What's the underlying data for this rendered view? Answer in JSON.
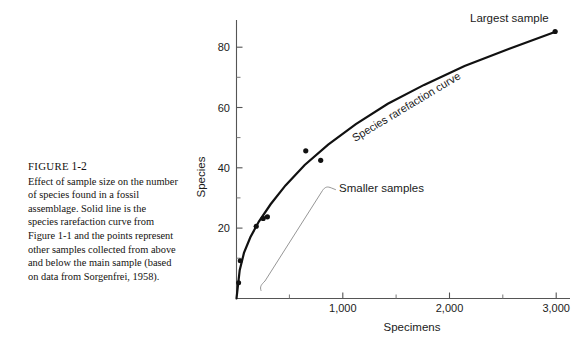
{
  "caption": {
    "figure_word": "FIGURE",
    "figure_number": "1-2",
    "text": "Effect of sample size on the number of species found in a fossil assemblage. Solid line is the species rarefaction curve from Figure 1-1 and the points represent other samples collected from above and below the main sample (based on data from Sorgenfrei, 1958)."
  },
  "chart_data": {
    "type": "line",
    "title": "",
    "xlabel": "Specimens",
    "ylabel": "Species",
    "xlim": [
      0,
      3150
    ],
    "ylim": [
      0,
      90
    ],
    "xticks": [
      1000,
      2000,
      3000
    ],
    "xtick_labels": [
      "1,000",
      "2,000",
      "3,000"
    ],
    "xminor_ticks": [
      500,
      1500,
      2500
    ],
    "yticks": [
      20,
      40,
      60,
      80
    ],
    "ytick_labels": [
      "20",
      "40",
      "60",
      "80"
    ],
    "yminor_ticks": [
      10,
      30,
      50,
      70
    ],
    "grid": false,
    "legend": "none",
    "series": [
      {
        "name": "Species rarefaction curve",
        "type": "line",
        "x": [
          0,
          30,
          70,
          130,
          210,
          320,
          460,
          640,
          860,
          1120,
          1420,
          1760,
          2140,
          2560,
          3000
        ],
        "y": [
          0,
          9,
          14.5,
          19.5,
          24.5,
          30,
          36,
          42.5,
          49,
          55.5,
          62,
          68,
          74,
          79.5,
          85
        ]
      },
      {
        "name": "Sample points",
        "type": "scatter",
        "points": [
          {
            "x": 20,
            "y": 5
          },
          {
            "x": 35,
            "y": 12
          },
          {
            "x": 185,
            "y": 23
          },
          {
            "x": 250,
            "y": 25.5
          },
          {
            "x": 290,
            "y": 26
          },
          {
            "x": 650,
            "y": 47
          },
          {
            "x": 790,
            "y": 44
          },
          {
            "x": 2990,
            "y": 85
          }
        ]
      }
    ],
    "annotations": [
      {
        "name": "largest-sample",
        "text": "Largest sample"
      },
      {
        "name": "smaller-samples",
        "text": "Smaller samples"
      },
      {
        "name": "curve-label",
        "text": "Species rarefaction curve"
      }
    ]
  },
  "colors": {
    "ink": "#1b1b1b",
    "curve": "#111111",
    "axis": "#555555",
    "leader": "#777777",
    "background": "#ffffff"
  }
}
